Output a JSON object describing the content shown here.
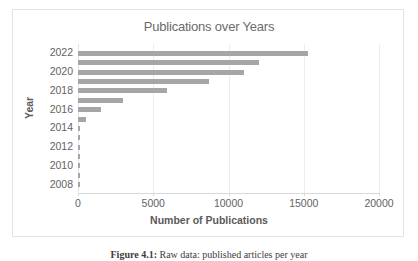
{
  "figure": {
    "caption_label": "Figure 4.1:",
    "caption_text": "Raw data: published articles per year",
    "background_color": "#ffffff"
  },
  "chart_data": {
    "type": "bar",
    "orientation": "horizontal",
    "title": "Publications over Years",
    "xlabel": "Number of Publications",
    "ylabel": "Year",
    "xlim": [
      0,
      20000
    ],
    "ylim": [
      2007,
      2023
    ],
    "grid": true,
    "legend": false,
    "bar_color": "#a6a6a6",
    "gridline_color": "#ededed",
    "axis_text_color": "#636363",
    "title_color": "#6b6b6b",
    "xticks": [
      0,
      5000,
      10000,
      15000,
      20000
    ],
    "xticklabels": [
      "0",
      "5000",
      "10000",
      "15000",
      "20000"
    ],
    "yticks": [
      2008,
      2010,
      2012,
      2014,
      2016,
      2018,
      2020,
      2022
    ],
    "yticklabels": [
      "2008",
      "2010",
      "2012",
      "2014",
      "2016",
      "2018",
      "2020",
      "2022"
    ],
    "categories": [
      2008,
      2009,
      2010,
      2011,
      2012,
      2013,
      2014,
      2015,
      2016,
      2017,
      2018,
      2019,
      2020,
      2021,
      2022
    ],
    "values": [
      20,
      25,
      30,
      35,
      40,
      60,
      120,
      520,
      1500,
      3000,
      5900,
      8700,
      11000,
      12000,
      15300
    ]
  }
}
